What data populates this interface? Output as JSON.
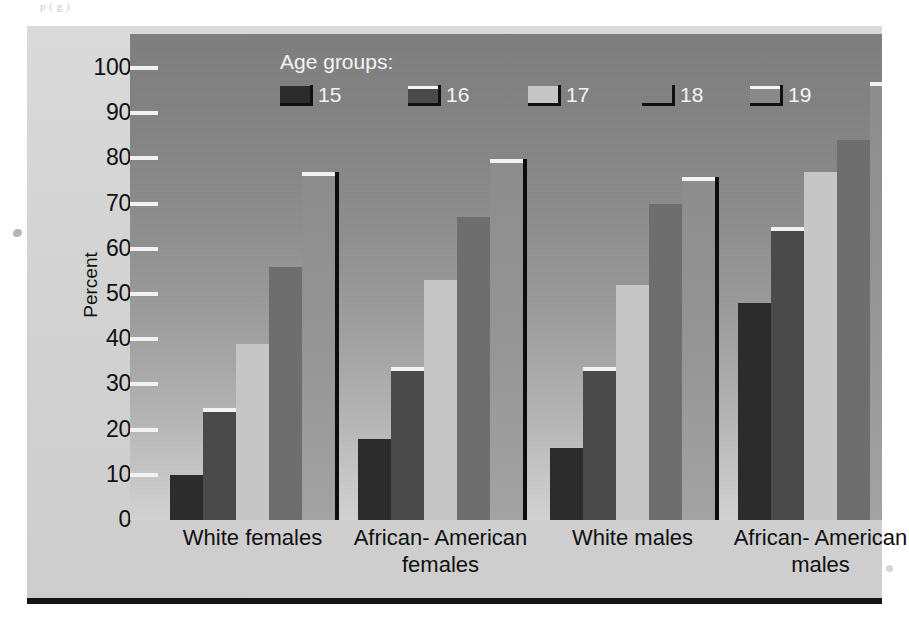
{
  "scan": {
    "top_text_fragment": "p                (              g                                   )"
  },
  "chart_data": {
    "type": "bar",
    "title": "",
    "xlabel": "",
    "ylabel": "Percent",
    "ylim": [
      0,
      100
    ],
    "ytick_values": [
      0,
      10,
      20,
      30,
      40,
      50,
      60,
      70,
      80,
      90,
      100
    ],
    "ytick_labels": [
      "0",
      "10",
      "20",
      "30",
      "40",
      "50",
      "60",
      "70",
      "80",
      "90",
      "100"
    ],
    "grid": false,
    "legend_title": "Age groups:",
    "legend_position": "upper center inside",
    "categories": [
      "White females",
      "African- American females",
      "White males",
      "African- American males"
    ],
    "category_lines": [
      [
        "White females"
      ],
      [
        "African- American",
        "females"
      ],
      [
        "White males"
      ],
      [
        "African- American",
        "males"
      ]
    ],
    "series": [
      {
        "name": "15",
        "values": [
          10,
          18,
          16,
          48
        ],
        "color": "#2c2c2c"
      },
      {
        "name": "16",
        "values": [
          24,
          33,
          33,
          64
        ],
        "color": "#4a4a4a"
      },
      {
        "name": "17",
        "values": [
          39,
          53,
          52,
          77
        ],
        "color": "#c6c6c6"
      },
      {
        "name": "18",
        "values": [
          56,
          67,
          70,
          84
        ],
        "color": "#6e6e6e"
      },
      {
        "name": "19",
        "values": [
          76,
          79,
          75,
          96
        ],
        "color": "#8a8a8a"
      }
    ]
  },
  "colors": {
    "plot_background_top": "#7f7f7f",
    "plot_background_bottom": "#d3d3d3",
    "panel_background": "#d7d7d7",
    "axis_text": "#101010",
    "legend_text": "#f4f4f4",
    "tick_mark": "#f2f2f2",
    "bar_edge": "#0d0d0d",
    "rule": "#151515"
  }
}
